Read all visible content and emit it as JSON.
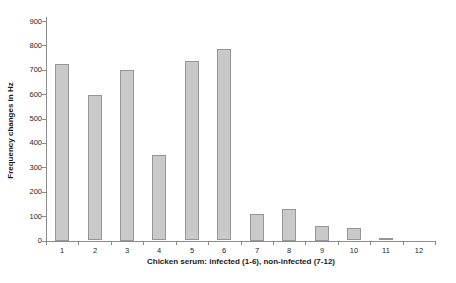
{
  "chart_data": {
    "type": "bar",
    "title": "",
    "xlabel": "Chicken serum: infected (1-6), non-infected (7-12)",
    "ylabel": "Frequency changes in Hz",
    "categories": [
      "1",
      "2",
      "3",
      "4",
      "5",
      "6",
      "7",
      "8",
      "9",
      "10",
      "11",
      "12"
    ],
    "values": [
      725,
      595,
      700,
      350,
      735,
      785,
      110,
      130,
      60,
      50,
      10,
      0
    ],
    "ylim": [
      0,
      900
    ],
    "ytick_step": 100,
    "yticks": [
      0,
      100,
      200,
      300,
      400,
      500,
      600,
      700,
      800,
      900
    ],
    "grid": "off",
    "legend": "none",
    "bar_fill_color": "#c9c9c9",
    "bar_border_color": "#969696",
    "axis_color": "#8c8c8c",
    "text_color": "#262626"
  }
}
